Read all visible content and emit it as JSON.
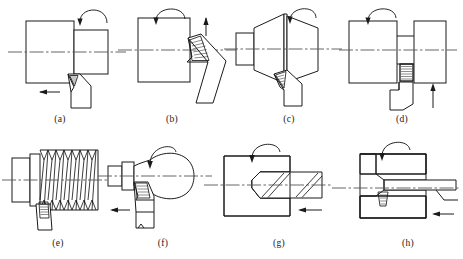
{
  "figure": {
    "type": "engineering-diagram",
    "panel_count": 8,
    "rows": 2,
    "columns": 4
  },
  "style": {
    "line_color": "#1a1a1a",
    "axis_color": "#555555",
    "background": "#ffffff",
    "hatch_color": "#1a1a1a",
    "insert_fill": "#ffffff"
  },
  "panels": [
    {
      "id": "a",
      "caption": "(a)",
      "operation": "cylindrical-turning",
      "workpiece": "stepped-shaft",
      "tool": "right-hand-turning-tool",
      "rotation_arrow": "clockwise-top",
      "feed_arrow": "left",
      "has_centerline": true
    },
    {
      "id": "b",
      "caption": "(b)",
      "operation": "facing",
      "workpiece": "cylinder-end",
      "tool": "angled-facing-tool",
      "rotation_arrow": "clockwise-top",
      "feed_arrow": "up",
      "has_centerline": true
    },
    {
      "id": "c",
      "caption": "(c)",
      "operation": "taper-turning",
      "workpiece": "double-cone-shaft",
      "tool": "angled-taper-tool",
      "rotation_arrow": "clockwise-top",
      "feed_arrow": "none",
      "has_centerline": true
    },
    {
      "id": "d",
      "caption": "(d)",
      "operation": "grooving-parting",
      "workpiece": "split-cylinder",
      "tool": "parting-blade",
      "rotation_arrow": "clockwise-top",
      "feed_arrow": "up",
      "has_centerline": true
    },
    {
      "id": "e",
      "caption": "(e)",
      "operation": "thread-cutting",
      "workpiece": "threaded-shaft",
      "tool": "threading-tool",
      "thread_teeth": 7,
      "rotation_arrow": "none",
      "feed_arrow": "none",
      "has_centerline": true
    },
    {
      "id": "f",
      "caption": "(f)",
      "operation": "form-turning",
      "workpiece": "barrel-contour-shaft",
      "tool": "form-tool",
      "rotation_arrow": "clockwise-top",
      "feed_arrow": "left",
      "has_centerline": true
    },
    {
      "id": "g",
      "caption": "(g)",
      "operation": "drilling",
      "workpiece": "hatched-block",
      "tool": "twist-drill",
      "rotation_arrow": "clockwise-top",
      "feed_arrow": "left",
      "has_centerline": true
    },
    {
      "id": "h",
      "caption": "(h)",
      "operation": "boring",
      "workpiece": "hatched-block-with-bore",
      "tool": "boring-bar",
      "rotation_arrow": "clockwise-top",
      "feed_arrow": "left",
      "has_centerline": true
    }
  ]
}
